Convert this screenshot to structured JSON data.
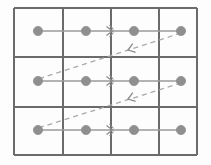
{
  "figure": {
    "name": "grid-lattice-dashed-arrow-diagram",
    "width": 211,
    "height": 165,
    "background_color": "#fdfdfd"
  },
  "colors": {
    "grid_line": "#6b6b6b",
    "border": "#6b6b6b",
    "node_fill": "#8f8f8f",
    "node_stroke": "#8f8f8f",
    "row_line": "#9a9a9a",
    "dashed_line": "#a9a9a9",
    "arrow_marker": "#8a8a8a"
  },
  "grid": {
    "columns": 4,
    "rows": 3,
    "vertical_line_x": [
      14,
      63,
      111,
      159,
      197
    ],
    "horizontal_line_y": [
      8,
      57,
      107,
      155
    ],
    "border_width": 2,
    "inner_width": 2
  },
  "nodes": [
    {
      "id": "n-r1-c1",
      "row": 1,
      "col": 1,
      "cx": 38,
      "cy": 31,
      "r": 4.6
    },
    {
      "id": "n-r1-c2",
      "row": 1,
      "col": 2,
      "cx": 86,
      "cy": 31,
      "r": 4.6
    },
    {
      "id": "n-r1-c3",
      "row": 1,
      "col": 3,
      "cx": 134,
      "cy": 31,
      "r": 4.6
    },
    {
      "id": "n-r1-c4",
      "row": 1,
      "col": 4,
      "cx": 181,
      "cy": 31,
      "r": 4.6
    },
    {
      "id": "n-r2-c1",
      "row": 2,
      "col": 1,
      "cx": 38,
      "cy": 81,
      "r": 4.6
    },
    {
      "id": "n-r2-c2",
      "row": 2,
      "col": 2,
      "cx": 86,
      "cy": 81,
      "r": 4.6
    },
    {
      "id": "n-r2-c3",
      "row": 2,
      "col": 3,
      "cx": 134,
      "cy": 81,
      "r": 4.6
    },
    {
      "id": "n-r2-c4",
      "row": 2,
      "col": 4,
      "cx": 181,
      "cy": 81,
      "r": 4.6
    },
    {
      "id": "n-r3-c1",
      "row": 3,
      "col": 1,
      "cx": 38,
      "cy": 130,
      "r": 4.6
    },
    {
      "id": "n-r3-c2",
      "row": 3,
      "col": 2,
      "cx": 86,
      "cy": 130,
      "r": 4.6
    },
    {
      "id": "n-r3-c3",
      "row": 3,
      "col": 3,
      "cx": 134,
      "cy": 130,
      "r": 4.6
    },
    {
      "id": "n-r3-c4",
      "row": 3,
      "col": 4,
      "cx": 181,
      "cy": 130,
      "r": 4.6
    }
  ],
  "row_paths": [
    {
      "id": "row-path-1",
      "row": 1,
      "x1": 38,
      "y1": 31,
      "x2": 181,
      "y2": 31
    },
    {
      "id": "row-path-2",
      "row": 2,
      "x1": 38,
      "y1": 81,
      "x2": 181,
      "y2": 81
    },
    {
      "id": "row-path-3",
      "row": 3,
      "x1": 38,
      "y1": 130,
      "x2": 181,
      "y2": 130
    }
  ],
  "row_direction_markers": [
    {
      "id": "marker-row-1",
      "x": 111,
      "y": 31
    },
    {
      "id": "marker-row-2",
      "x": 111,
      "y": 81
    },
    {
      "id": "marker-row-3",
      "x": 111,
      "y": 130
    }
  ],
  "dashed_connectors": [
    {
      "id": "dashed-connector-1",
      "from_node": "n-r1-c4",
      "to_node": "n-r2-c1",
      "x1": 181,
      "y1": 33,
      "x2": 38,
      "y2": 79,
      "arrow_x": 128,
      "arrow_y": 50
    },
    {
      "id": "dashed-connector-2",
      "from_node": "n-r2-c4",
      "to_node": "n-r3-c1",
      "x1": 181,
      "y1": 83,
      "x2": 38,
      "y2": 128,
      "arrow_x": 128,
      "arrow_y": 99
    }
  ],
  "style": {
    "dash_pattern": "5,4",
    "row_line_width": 1.6,
    "dashed_line_width": 1.3
  }
}
